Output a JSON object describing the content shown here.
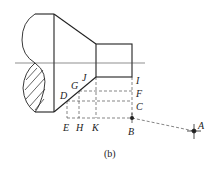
{
  "caption": "(b)",
  "points": {
    "A": "A",
    "B": "B",
    "C": "C",
    "D": "D",
    "E": "E",
    "F": "F",
    "G": "G",
    "H": "H",
    "I": "I",
    "J": "J",
    "K": "K"
  },
  "colors": {
    "stroke": "#222222",
    "background": "#ffffff"
  }
}
